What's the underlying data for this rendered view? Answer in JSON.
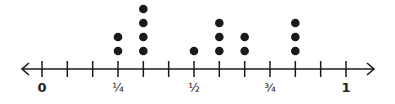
{
  "chart_data": {
    "type": "scatter",
    "subtype": "line-plot (dot plot)",
    "title": "",
    "xlabel": "",
    "ylabel": "",
    "xlim": [
      0,
      1
    ],
    "tick_step_fraction": "1/12",
    "ticks": [
      0,
      0.0833,
      0.1667,
      0.25,
      0.3333,
      0.4167,
      0.5,
      0.5833,
      0.6667,
      0.75,
      0.8333,
      0.9167,
      1
    ],
    "tick_labels": [
      {
        "value": 0,
        "text": "0"
      },
      {
        "value": 0.25,
        "text": "¼"
      },
      {
        "value": 0.5,
        "text": "½"
      },
      {
        "value": 0.75,
        "text": "¾"
      },
      {
        "value": 1,
        "text": "1"
      }
    ],
    "points": [
      {
        "x": "3/12",
        "value": 0.25,
        "count": 2
      },
      {
        "x": "4/12",
        "value": 0.3333,
        "count": 4
      },
      {
        "x": "6/12",
        "value": 0.5,
        "count": 1
      },
      {
        "x": "7/12",
        "value": 0.5833,
        "count": 3
      },
      {
        "x": "8/12",
        "value": 0.6667,
        "count": 2
      },
      {
        "x": "10/12",
        "value": 0.8333,
        "count": 3
      }
    ],
    "arrows": "both-ends",
    "grid": false,
    "legend": "none"
  },
  "colors": {
    "ink": "#1a1a1a"
  }
}
